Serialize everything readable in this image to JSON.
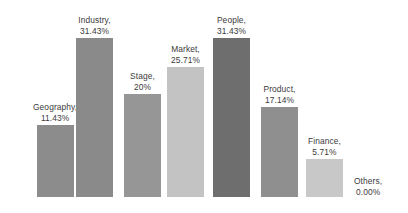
{
  "chart_data": {
    "type": "bar",
    "title": "",
    "subtitle": "",
    "xlabel": "",
    "ylabel": "",
    "grid": false,
    "legend": "none",
    "axis_visible": false,
    "ylim": [
      0,
      35
    ],
    "categories": [
      "Geography",
      "Industry",
      "Stage",
      "Market",
      "People",
      "Product",
      "Finance",
      "Others"
    ],
    "values": [
      11.43,
      31.43,
      20,
      25.71,
      31.43,
      17.14,
      5.71,
      0
    ],
    "value_labels": [
      "11.43%",
      "31.43%",
      "20%",
      "25.71%",
      "31.43%",
      "17.14%",
      "5.71%",
      "0.00%"
    ],
    "data_label_format": "{category}, {value}",
    "bars": [
      {
        "name": "Geography",
        "value": 11.43,
        "value_label": "11.43%",
        "label_line1": "Geography,",
        "label_line2": "11.43%",
        "color": "#8c8c8c",
        "left": 33,
        "height": 72
      },
      {
        "name": "Industry",
        "value": 31.43,
        "value_label": "31.43%",
        "label_line1": "Industry,",
        "label_line2": "31.43%",
        "color": "#8a8a8a",
        "left": 76,
        "height": 159
      },
      {
        "name": "Stage",
        "value": 20,
        "value_label": "20%",
        "label_line1": "Stage,",
        "label_line2": "20%",
        "color": "#969696",
        "left": 124,
        "height": 103
      },
      {
        "name": "Market",
        "value": 25.71,
        "value_label": "25.71%",
        "label_line1": "Market,",
        "label_line2": "25.71%",
        "color": "#c3c3c3",
        "left": 167,
        "height": 130
      },
      {
        "name": "People",
        "value": 31.43,
        "value_label": "31.43%",
        "label_line1": "People,",
        "label_line2": "31.43%",
        "color": "#6e6e6e",
        "left": 213,
        "height": 159
      },
      {
        "name": "Product",
        "value": 17.14,
        "value_label": "17.14%",
        "label_line1": "Product,",
        "label_line2": "17.14%",
        "color": "#8f8f8f",
        "left": 261,
        "height": 90
      },
      {
        "name": "Finance",
        "value": 5.71,
        "value_label": "5.71%",
        "label_line1": "Finance,",
        "label_line2": "5.71%",
        "color": "#c8c8c8",
        "left": 306,
        "height": 38
      },
      {
        "name": "Others",
        "value": 0,
        "value_label": "0.00%",
        "label_line1": "Others,",
        "label_line2": "0.00%",
        "color": "#cccccc",
        "left": 354,
        "height": 0
      }
    ]
  }
}
